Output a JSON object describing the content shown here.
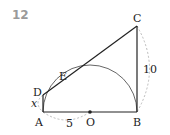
{
  "problem": {
    "number": "12"
  },
  "figure": {
    "points": {
      "A": "A",
      "B": "B",
      "C": "C",
      "D": "D",
      "E": "E",
      "O": "O"
    },
    "labels": {
      "AO": "5",
      "BC": "10",
      "AD": "x"
    },
    "colors": {
      "line": "#222222",
      "dashed": "#aaaaaa",
      "number": "#9a9a9a"
    }
  }
}
